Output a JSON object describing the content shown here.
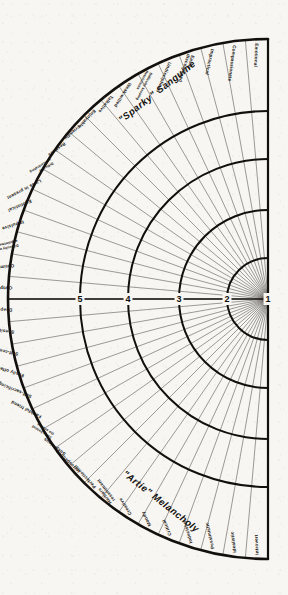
{
  "figure": {
    "type": "radial-segment-chart",
    "center": {
      "x": 268,
      "y": 299
    },
    "outer_radius": 260,
    "ink_color": "#141210",
    "paper_color": "#f7f6f2"
  },
  "corner_labels": [
    {
      "name": "sanguine-label",
      "text": "\"Sparky\" Sanguine",
      "position": "upper-left"
    },
    {
      "name": "melancholy-label",
      "text": "\"Artie\" Melancholy",
      "position": "lower-left"
    }
  ],
  "axis": {
    "name": "intensity-scale",
    "ticks": [
      {
        "label": "5",
        "radius": 188
      },
      {
        "label": "4",
        "radius": 140
      },
      {
        "label": "3",
        "radius": 89
      },
      {
        "label": "2",
        "radius": 41
      },
      {
        "label": "1",
        "radius": 0
      }
    ]
  },
  "ring_radii": [
    260,
    188,
    140,
    89,
    41,
    0
  ],
  "chart_data": {
    "type": "radial-segment-chart",
    "xlabel": "",
    "ylabel": "Intensity",
    "axis_tick_labels": [
      "5",
      "4",
      "3",
      "2",
      "1"
    ],
    "axis_tick_radii": [
      188,
      140,
      89,
      41,
      0
    ],
    "ring_boundaries": [
      260,
      188,
      140,
      89,
      41,
      0
    ],
    "grid": true,
    "legend_position": "none",
    "half_span_degrees": 90,
    "segments_per_half": 18,
    "series": [
      {
        "name": "\"Sparky\" Sanguine",
        "half": "upper",
        "categories": [
          "Outgoing",
          "Optimistic",
          "Difficulty with appointments",
          "Impulsive",
          "Egotistical",
          "Lives in present",
          "Difficulty concentrating",
          "Restless",
          "Friendly",
          "Enjoyable",
          "Talkative",
          "Weak-willed",
          "Difficulty keeping Resolutions",
          "Undisciplined",
          "Easily discouraged",
          "Impractical",
          "Compassionate",
          "Emotional"
        ]
      },
      {
        "name": "\"Artie\" Melancholy",
        "half": "lower",
        "categories": [
          "Deep feeling",
          "Sensitive",
          "Self-centered",
          "Easily offended",
          "Self-sacrificing",
          "Faithful friend",
          "Likes behind the scenes",
          "Suspicious",
          "Introspective",
          "Perfectionist",
          "Harbors resentment",
          "Creative",
          "Moody",
          "Critical",
          "Indecisive",
          "Pessimistic",
          "Idealistic",
          "Introvert"
        ]
      }
    ]
  }
}
